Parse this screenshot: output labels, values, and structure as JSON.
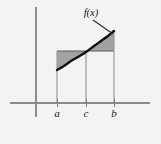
{
  "figure": {
    "title": "",
    "background_color": "#f4f4f4",
    "width": 161,
    "height": 144
  },
  "chart_data": {
    "type": "line",
    "title": "",
    "subtitle": "",
    "xlabel": "",
    "ylabel": "",
    "grid": false,
    "legend_position": "none",
    "axes": {
      "x_axis": {
        "y_pixel": 103,
        "x_start_pixel": 10,
        "x_end_pixel": 150
      },
      "y_axis": {
        "x_pixel": 36,
        "y_start_pixel": 7,
        "y_end_pixel": 117
      },
      "origin": {
        "x_pixel": 36,
        "y_pixel": 103
      }
    },
    "x_ticks": [
      {
        "label": "a",
        "x_pixel": 57
      },
      {
        "label": "c",
        "x_pixel": 86
      },
      {
        "label": "b",
        "x_pixel": 114
      }
    ],
    "tick_labels": [
      "a",
      "c",
      "b"
    ],
    "series": [
      {
        "name": "f(x)",
        "label": "f(x)",
        "color": "#111111",
        "points_pixel": [
          [
            57,
            70
          ],
          [
            64,
            66
          ],
          [
            71,
            61
          ],
          [
            78,
            57
          ],
          [
            86,
            52
          ],
          [
            94,
            46
          ],
          [
            101,
            41
          ],
          [
            108,
            36
          ],
          [
            114,
            31
          ]
        ]
      }
    ],
    "annotations": [
      {
        "name": "curve-label",
        "text": "f(x)",
        "x_pixel": 91,
        "y_pixel": 16,
        "leader_to_pixel": [
          113,
          34
        ]
      }
    ],
    "shaded_regions": [
      {
        "name": "left-region",
        "description": "area between the horizontal level f(c) and the curve, from a to c (above the curve)",
        "color": "#a3a3a3",
        "from": "a",
        "to": "c"
      },
      {
        "name": "right-region",
        "description": "area between the horizontal level f(c) and the curve, from c to b (below the curve)",
        "color": "#a3a3a3",
        "from": "c",
        "to": "b"
      }
    ],
    "reference_level": {
      "name": "midpoint-chord",
      "label": "f(c)",
      "y_pixel": 51,
      "x_from_pixel": 57,
      "x_to_pixel": 114
    },
    "drop_lines": [
      {
        "label": "a",
        "x_pixel": 57,
        "y_top_pixel": 51,
        "y_bottom_pixel": 103
      },
      {
        "label": "c",
        "x_pixel": 86,
        "y_top_pixel": 52,
        "y_bottom_pixel": 103
      },
      {
        "label": "b",
        "x_pixel": 114,
        "y_top_pixel": 31,
        "y_bottom_pixel": 103
      }
    ],
    "colors": {
      "curve": "#111111",
      "shading": "#a3a3a3",
      "axis": "#8c8c8c",
      "drop_line": "#9a9a9a",
      "text": "#1a1a1a",
      "background": "#f4f4f4"
    }
  }
}
